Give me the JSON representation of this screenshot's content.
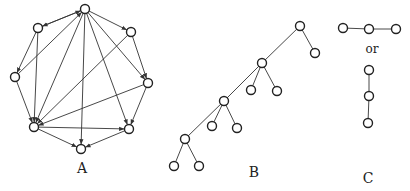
{
  "figure": {
    "panels": [
      {
        "id": "A",
        "label": "A",
        "label_pos": [
          82,
          173
        ],
        "directed": true,
        "nodes": [
          [
            85,
            9
          ],
          [
            38,
            28
          ],
          [
            131,
            32
          ],
          [
            15,
            77
          ],
          [
            148,
            83
          ],
          [
            34,
            127
          ],
          [
            129,
            129
          ],
          [
            81,
            149
          ]
        ],
        "edges": [
          [
            0,
            1
          ],
          [
            0,
            2
          ],
          [
            0,
            5
          ],
          [
            0,
            7
          ],
          [
            0,
            6
          ],
          [
            0,
            4
          ],
          [
            1,
            3
          ],
          [
            1,
            5
          ],
          [
            2,
            4
          ],
          [
            2,
            5
          ],
          [
            3,
            5
          ],
          [
            3,
            0
          ],
          [
            4,
            6
          ],
          [
            4,
            5
          ],
          [
            5,
            6
          ],
          [
            5,
            7
          ],
          [
            6,
            7
          ],
          [
            1,
            0
          ]
        ]
      },
      {
        "id": "B",
        "label": "B",
        "label_pos": [
          254,
          177
        ],
        "directed": false,
        "nodes": [
          [
            300,
            26
          ],
          [
            315,
            53
          ],
          [
            262,
            63
          ],
          [
            251,
            90
          ],
          [
            277,
            91
          ],
          [
            224,
            101
          ],
          [
            212,
            126
          ],
          [
            237,
            128
          ],
          [
            185,
            139
          ],
          [
            174,
            166
          ],
          [
            199,
            166
          ]
        ],
        "edges": [
          [
            0,
            1
          ],
          [
            0,
            2
          ],
          [
            2,
            3
          ],
          [
            2,
            4
          ],
          [
            2,
            5
          ],
          [
            5,
            6
          ],
          [
            5,
            7
          ],
          [
            5,
            8
          ],
          [
            8,
            9
          ],
          [
            8,
            10
          ]
        ]
      },
      {
        "id": "C",
        "label": "C",
        "label_pos": [
          368,
          183
        ],
        "or_text": "or",
        "or_pos": [
          372,
          53
        ],
        "directed": false,
        "nodes": [
          [
            343,
            28
          ],
          [
            369,
            29
          ],
          [
            396,
            29
          ],
          [
            369,
            70
          ],
          [
            369,
            96
          ],
          [
            368,
            123
          ]
        ],
        "edges": [
          [
            0,
            1
          ],
          [
            1,
            2
          ],
          [
            3,
            4
          ],
          [
            4,
            5
          ]
        ]
      }
    ],
    "node_radius": 4.5
  }
}
